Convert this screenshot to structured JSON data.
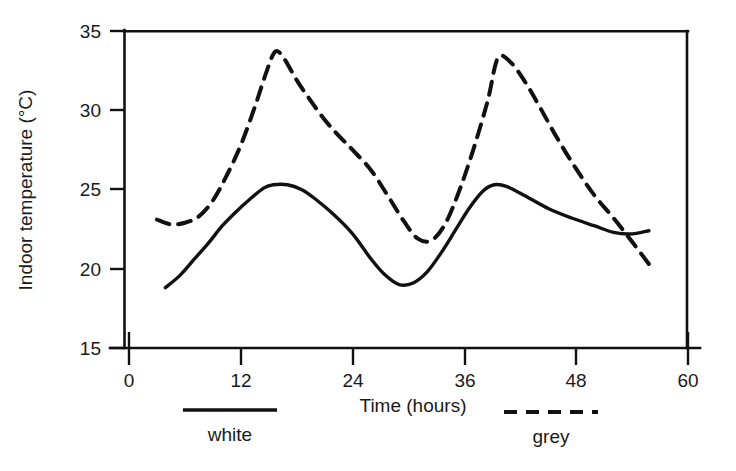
{
  "chart_data": {
    "type": "line",
    "title": "",
    "xlabel": "Time (hours)",
    "ylabel": "Indoor temperature (°C)",
    "xlim": [
      0,
      60
    ],
    "ylim": [
      15,
      35
    ],
    "xticks": [
      0,
      12,
      24,
      36,
      48,
      60
    ],
    "yticks": [
      15,
      20,
      25,
      30,
      35
    ],
    "xtick_labels": [
      "0",
      "12",
      "24",
      "36",
      "48",
      "60"
    ],
    "ytick_labels": [
      "15",
      "20",
      "25",
      "30",
      "35"
    ],
    "grid": false,
    "legend_position": "below-axes",
    "series": [
      {
        "name": "white",
        "style": "solid",
        "color": "#111111",
        "x": [
          3.9,
          5.5,
          7.0,
          8.5,
          10.0,
          11.5,
          13.0,
          14.5,
          15.5,
          17.0,
          18.5,
          20.0,
          22.0,
          24.0,
          26.0,
          27.5,
          29.0,
          30.5,
          32.0,
          33.5,
          35.0,
          36.5,
          38.0,
          39.2,
          40.5,
          42.5,
          45.0,
          47.5,
          50.0,
          52.0,
          54.0,
          55.8
        ],
        "y": [
          18.8,
          19.6,
          20.6,
          21.6,
          22.7,
          23.6,
          24.4,
          25.1,
          25.3,
          25.3,
          25.0,
          24.4,
          23.4,
          22.2,
          20.6,
          19.6,
          19.0,
          19.1,
          19.8,
          21.0,
          22.4,
          23.8,
          24.9,
          25.3,
          25.2,
          24.6,
          23.8,
          23.2,
          22.7,
          22.3,
          22.2,
          22.4
        ]
      },
      {
        "name": "grey",
        "style": "dashed",
        "color": "#111111",
        "x": [
          3.0,
          4.5,
          6.0,
          7.5,
          9.0,
          10.5,
          12.0,
          13.5,
          14.8,
          15.7,
          16.6,
          18.0,
          19.5,
          21.0,
          22.5,
          24.0,
          26.0,
          28.0,
          29.5,
          31.0,
          32.5,
          34.0,
          35.5,
          37.0,
          38.5,
          39.6,
          41.0,
          42.5,
          44.0,
          46.0,
          48.0,
          50.0,
          52.0,
          54.0,
          55.8
        ],
        "y": [
          23.1,
          22.8,
          22.9,
          23.3,
          24.3,
          25.9,
          27.8,
          30.2,
          32.5,
          33.7,
          33.3,
          31.9,
          30.6,
          29.4,
          28.4,
          27.5,
          26.2,
          24.4,
          23.0,
          21.9,
          21.8,
          22.9,
          25.0,
          27.6,
          30.6,
          33.3,
          33.0,
          31.8,
          30.3,
          28.2,
          26.3,
          24.6,
          23.2,
          21.7,
          20.3
        ]
      }
    ],
    "legend": [
      {
        "label": "white",
        "style": "solid"
      },
      {
        "label": "grey",
        "style": "dashed"
      }
    ],
    "annotations": []
  }
}
